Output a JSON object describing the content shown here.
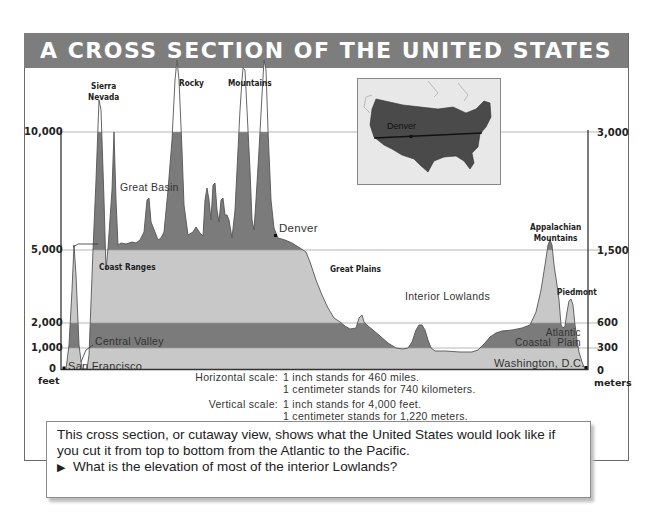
{
  "title": "A CROSS SECTION OF THE UNITED STATES",
  "left_axis": {
    "unit": "feet",
    "ticks": [
      {
        "value": 0,
        "label": "0"
      },
      {
        "value": 1000,
        "label": "1,000"
      },
      {
        "value": 2000,
        "label": "2,000"
      },
      {
        "value": 5000,
        "label": "5,000"
      },
      {
        "value": 10000,
        "label": "10,000"
      }
    ]
  },
  "right_axis": {
    "unit": "meters",
    "ticks": [
      {
        "value": 0,
        "label": "0"
      },
      {
        "value": 300,
        "label": "300"
      },
      {
        "value": 600,
        "label": "600"
      },
      {
        "value": 1500,
        "label": "1,500"
      },
      {
        "value": 3000,
        "label": "3,000"
      }
    ]
  },
  "labels": {
    "sierra_nevada": "Sierra\nNevada",
    "rocky": "Rocky",
    "mountains": "Mountains",
    "great_basin": "Great  Basin",
    "denver": "Denver",
    "coast_ranges": "Coast  Ranges",
    "central_valley": "Central  Valley",
    "san_francisco": "San  Francisco",
    "great_plains": "Great  Plains",
    "interior_lowlands": "Interior  Lowlands",
    "appalachian": "Appalachian\nMountains",
    "piedmont": "Piedmont",
    "atlantic_coastal_plain": "Atlantic\nCoastal  Plain",
    "washington": "Washington,  D.C."
  },
  "inset_map": {
    "label": "Denver"
  },
  "scale": {
    "horizontal_key": "Horizontal scale:",
    "horizontal_line1": "1  inch  stands  for  460  miles.",
    "horizontal_line2": "1  centimeter  stands  for  740  kilometers.",
    "vertical_key": "Vertical scale:",
    "vertical_line1": "1  inch  stands  for  4,000  feet.",
    "vertical_line2": "1  centimeter  stands  for  1,220  meters."
  },
  "caption": {
    "text": "This cross section, or cutaway view, shows what the United States would look like if you cut it from top to bottom from the Atlantic to the Pacific.",
    "question_marker": "▶",
    "question": "What is the elevation of most of the interior Lowlands?"
  },
  "colors": {
    "title_bar": "#7d7d7d",
    "band_dark": "#7b7b7b",
    "band_light": "#c8c8c8",
    "outline": "#555555"
  }
}
